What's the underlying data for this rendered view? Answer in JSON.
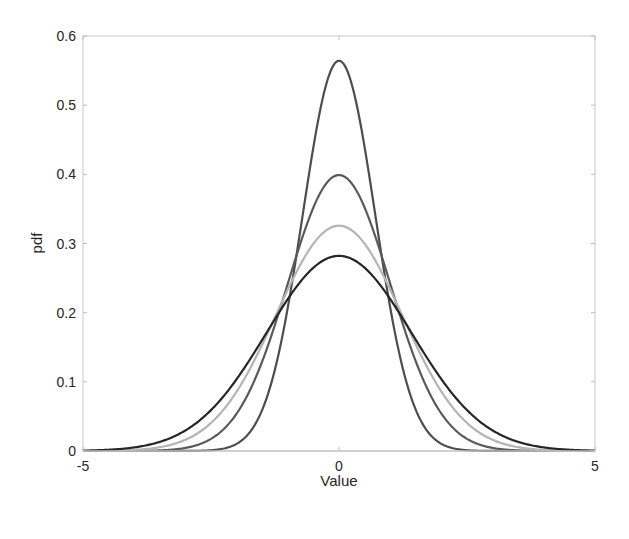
{
  "chart_data": {
    "type": "line",
    "title": "",
    "xlabel": "Value",
    "ylabel": "pdf",
    "xlim": [
      -5,
      5
    ],
    "ylim": [
      0,
      0.6
    ],
    "xticks": [
      -5,
      0,
      5
    ],
    "xtick_labels": [
      "-5",
      "0",
      "5"
    ],
    "yticks": [
      0,
      0.1,
      0.2,
      0.3,
      0.4,
      0.5,
      0.6
    ],
    "ytick_labels": [
      "0",
      "0.1",
      "0.2",
      "0.3",
      "0.4",
      "0.5",
      "0.6"
    ],
    "grid": false,
    "legend": null,
    "series": [
      {
        "name": "Normal (mu=0, sigma^2=0.5)",
        "distribution": "normal",
        "mu": 0,
        "sigma": 0.7071,
        "peak": 0.564,
        "color": "#4d4d4d"
      },
      {
        "name": "Normal (mu=0, sigma^2=1)",
        "distribution": "normal",
        "mu": 0,
        "sigma": 1.0,
        "peak": 0.399,
        "color": "#5a5a5a"
      },
      {
        "name": "Normal (mu=0, sigma^2=1.5)",
        "distribution": "normal",
        "mu": 0,
        "sigma": 1.2247,
        "peak": 0.326,
        "color": "#b4b4b4"
      },
      {
        "name": "Normal (mu=0, sigma^2=2)",
        "distribution": "normal",
        "mu": 0,
        "sigma": 1.4142,
        "peak": 0.282,
        "color": "#262626"
      }
    ]
  },
  "axes": {
    "xlabel": "Value",
    "ylabel": "pdf"
  }
}
